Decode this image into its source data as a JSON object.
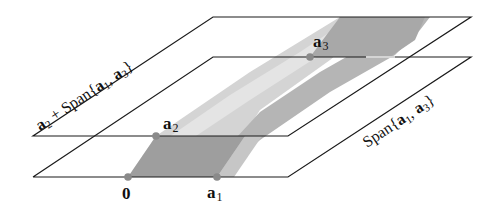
{
  "figure": {
    "planes": {
      "upper": {
        "label_vec": "a",
        "label_vec_sub": "2",
        "label_rest": " + Span{",
        "label_a1": "a",
        "label_a1_sub": "1",
        "label_comma": ", ",
        "label_a3": "a",
        "label_a3_sub": "3",
        "label_close": "}"
      },
      "lower": {
        "label_span": "Span{",
        "label_a1": "a",
        "label_a1_sub": "1",
        "label_comma": ", ",
        "label_a3": "a",
        "label_a3_sub": "3",
        "label_close": "}"
      }
    },
    "points": {
      "origin": {
        "label": "0"
      },
      "a1": {
        "label": "a",
        "sub": "1"
      },
      "a2": {
        "label": "a",
        "sub": "2"
      },
      "a3": {
        "label": "a",
        "sub": "3"
      }
    },
    "colors": {
      "line": "#1a1a1a",
      "dark_fill": "#9a9a9a",
      "mid_fill": "#b8b8b8",
      "light_fill": "#d6d6d6",
      "point": "#8a8a8a"
    }
  }
}
